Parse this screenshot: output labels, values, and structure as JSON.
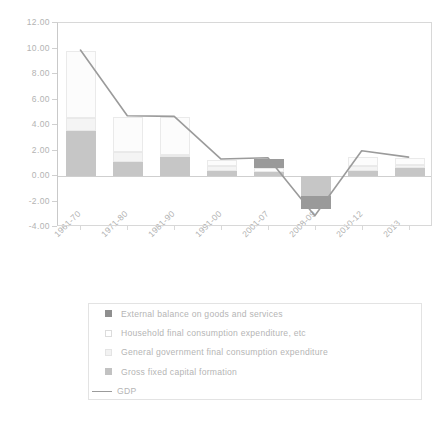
{
  "chart_data": {
    "type": "bar",
    "title": "",
    "subtitle": "",
    "xlabel": "",
    "ylabel": "",
    "stacked": true,
    "grid": false,
    "legend_position": "bottom",
    "ylim": [
      -4.0,
      12.0
    ],
    "ytick_step": 2.0,
    "ytick_labels": [
      "12.00",
      "10.00",
      "8.00",
      "6.00",
      "4.00",
      "2.00",
      "0.00",
      "-2.00",
      "-4.00"
    ],
    "ytick_values": [
      12.0,
      10.0,
      8.0,
      6.0,
      4.0,
      2.0,
      0.0,
      -2.0,
      -4.0
    ],
    "categories": [
      "1961-70",
      "1971-80",
      "1981-90",
      "1991-00",
      "2001-07",
      "2008-09",
      "2010-12",
      "2013"
    ],
    "series": [
      {
        "name": "External balance on goods and services",
        "kind": "bar",
        "color": "#9a9a9a",
        "values": [
          0.0,
          0.0,
          0.0,
          0.0,
          0.75,
          -1.0,
          0.0,
          0.0
        ]
      },
      {
        "name": "Household final consumption expenditure, etc",
        "kind": "bar",
        "color": "#fcfcfc",
        "values": [
          5.25,
          2.8,
          2.95,
          0.5,
          0.3,
          0.0,
          0.7,
          0.5
        ]
      },
      {
        "name": "General government final consumption expenditure",
        "kind": "bar",
        "color": "#f4f4f4",
        "values": [
          1.05,
          0.75,
          0.1,
          0.35,
          0.0,
          0.0,
          0.4,
          0.3
        ]
      },
      {
        "name": "Gross fixed capital formation",
        "kind": "bar",
        "color": "#c6c6c6",
        "values": [
          3.5,
          1.1,
          1.55,
          0.4,
          0.3,
          -1.6,
          0.4,
          0.6
        ]
      },
      {
        "name": "GDP",
        "kind": "line",
        "color": "#9b9b9b",
        "values": [
          9.8,
          4.65,
          4.6,
          1.25,
          1.35,
          -3.2,
          1.9,
          1.4
        ]
      }
    ],
    "legend_entries": [
      {
        "label": "External balance on goods and services",
        "swatch": "ext"
      },
      {
        "label": "Household final consumption expenditure, etc",
        "swatch": "hh"
      },
      {
        "label": "General government final consumption expenditure",
        "swatch": "gov"
      },
      {
        "label": "Gross fixed capital formation",
        "swatch": "gfcf"
      },
      {
        "label": "GDP",
        "swatch": "line"
      }
    ]
  }
}
